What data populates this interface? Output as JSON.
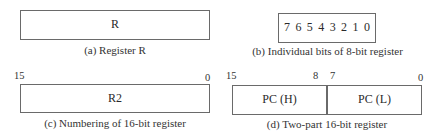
{
  "panels": {
    "a": {
      "register_label": "R",
      "caption": "(a) Register R"
    },
    "b": {
      "bits": [
        "7",
        "6",
        "5",
        "4",
        "3",
        "2",
        "1",
        "0"
      ],
      "caption": "(b) Individual bits of 8-bit register"
    },
    "c": {
      "register_label": "R2",
      "msb_label": "15",
      "lsb_label": "0",
      "caption": "(c) Numbering of 16-bit register"
    },
    "d": {
      "high_label": "PC (H)",
      "low_label": "PC (L)",
      "bit_labels": {
        "msb": "15",
        "high_lsb": "8",
        "low_msb": "7",
        "lsb": "0"
      },
      "caption": "(d) Two-part 16-bit register"
    }
  }
}
